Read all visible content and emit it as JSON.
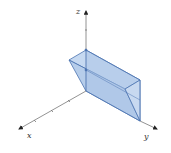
{
  "diagram": {
    "type": "3d-solid",
    "axes": {
      "x": "x",
      "y": "y",
      "z": "z"
    },
    "colors": {
      "fill": "#a9c4e6",
      "edge": "#4a72b0",
      "axis": "#555555"
    }
  }
}
